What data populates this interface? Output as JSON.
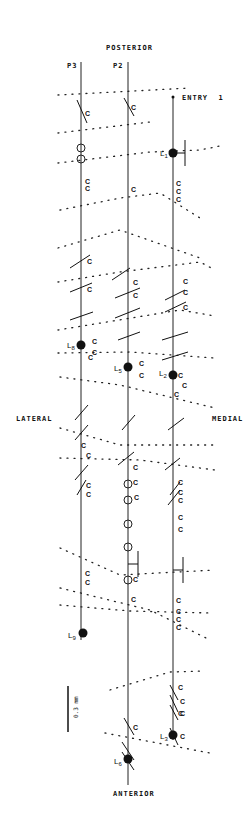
{
  "orientation": {
    "top": "POSTERIOR",
    "bottom": "ANTERIOR",
    "left": "LATERAL",
    "right": "MEDIAL"
  },
  "tracks": [
    {
      "id": "P3",
      "label": "P3",
      "x": 81,
      "y_start": 62,
      "y_end": 715,
      "lesion": {
        "label": "L",
        "sub": "8",
        "y": 345
      },
      "lesion2": {
        "label": "L",
        "sub": "9",
        "y": 633
      }
    },
    {
      "id": "P2",
      "label": "P2",
      "x": 128,
      "y_start": 62,
      "y_end": 785,
      "lesion": {
        "label": "L",
        "sub": "5",
        "y": 367
      },
      "lesion2": {
        "label": "L",
        "sub": "6",
        "y": 759
      }
    },
    {
      "id": "ENTRY1",
      "label": "ENTRY  1",
      "x": 173,
      "y_start": 97,
      "y_end": 740,
      "lesion": {
        "label": "L",
        "sub": "1",
        "y": 153
      },
      "lesion2": {
        "label": "L",
        "sub": "2",
        "y": 375
      },
      "lesion3": {
        "label": "L",
        "sub": "3",
        "y": 735
      }
    }
  ],
  "marker_letter": "C",
  "scale_bar": {
    "label": "0.3 mm",
    "x": 68,
    "y_top": 686,
    "y_bottom": 732
  }
}
